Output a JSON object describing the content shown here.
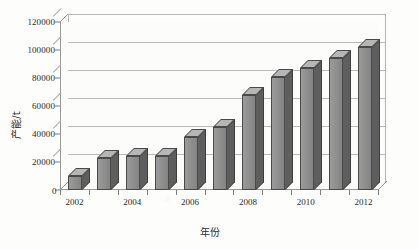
{
  "chart_data": {
    "type": "bar",
    "title": "",
    "subtitle": "",
    "xlabel": "年份",
    "ylabel": "产能/t",
    "categories": [
      "2002",
      "2003",
      "2004",
      "2005",
      "2006",
      "2007",
      "2008",
      "2009",
      "2010",
      "2011",
      "2012"
    ],
    "values": [
      10000,
      23000,
      24000,
      24000,
      38000,
      45000,
      68000,
      81000,
      87000,
      94000,
      102000
    ],
    "series": [
      {
        "name": "产能",
        "values": [
          10000,
          23000,
          24000,
          24000,
          38000,
          45000,
          68000,
          81000,
          87000,
          94000,
          102000
        ]
      }
    ],
    "ylim": [
      0,
      120000
    ],
    "ytick_step": 20000,
    "yticks": [
      0,
      20000,
      40000,
      60000,
      80000,
      100000,
      120000
    ],
    "ytick_labels": [
      "0",
      "20000",
      "40000",
      "60000",
      "80000",
      "100000",
      "120000"
    ],
    "xtick_labels_shown": [
      "2002",
      "2004",
      "2006",
      "2008",
      "2010",
      "2012"
    ],
    "grid": true,
    "grid_axis": "y",
    "legend": false,
    "legend_position": "none",
    "style_3d": true,
    "bar_color": "#8e8e8e",
    "bar_side_color": "#5e5e5e",
    "bar_top_color": "#b6b6b6",
    "bar_outline_color": "#4a4a4a",
    "grid_color": "#b9b9b9",
    "axis_color": "#9a9a9a",
    "background_color": "#fdfdfc",
    "text_color": "#2b2b2b"
  }
}
